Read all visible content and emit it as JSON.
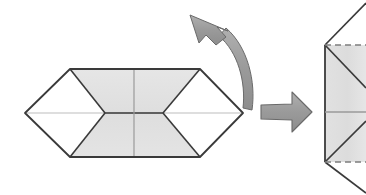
{
  "diagram": {
    "type": "origami-instruction-diagram",
    "canvas": {
      "width": 366,
      "height": 195,
      "background": "#ffffff"
    },
    "palette": {
      "paper_fill_shaded": "#e2e2e2",
      "paper_fill_white": "#ffffff",
      "edge_stroke": "#3a3a3a",
      "soft_crease_stroke": "#b4b4b4",
      "dashed_crease_stroke": "#8c8c8c",
      "arrow_fill": "#9e9e9e",
      "arrow_stroke": "#5a5a5a",
      "background": "#ffffff"
    },
    "panels": [
      {
        "id": "left-figure",
        "name": "flattened-hexagon-model",
        "description": "Wide flattened paper model: shaded central band with white triangular flaps forming diamonds at each end",
        "bounds": {
          "x": 25,
          "y": 69,
          "width": 218,
          "height": 88
        },
        "vertices": {
          "left_tip": [
            25,
            113
          ],
          "top_left": [
            70,
            69
          ],
          "top_right": [
            200,
            69
          ],
          "right_tip": [
            243,
            113
          ],
          "bottom_right": [
            200,
            157
          ],
          "bottom_left": [
            70,
            157
          ],
          "inner_left": [
            105,
            113
          ],
          "inner_right": [
            163,
            113
          ]
        },
        "creases": {
          "vertical_center_x": 134,
          "horizontal_center_y": 113
        }
      },
      {
        "id": "right-figure",
        "name": "rotated-model-partial",
        "description": "Result of the rotation, cropped by the right edge of the image; shaded vertical band with dashed fold lines top and bottom",
        "bounds": {
          "x": 325,
          "y": 0,
          "width": 41,
          "height": 195
        },
        "vertices": {
          "left_edge_x": 325,
          "upper_corner_y": 45,
          "lower_corner_y": 162,
          "horizontal_center_y": 112
        },
        "dashed_lines": [
          {
            "name": "top-dashed-crease",
            "y": 45
          },
          {
            "name": "bottom-dashed-crease",
            "y": 162
          }
        ],
        "cropped": true
      }
    ],
    "arrows": [
      {
        "id": "rotation-arrow",
        "name": "curved-rotation-arrow",
        "direction": "up-left",
        "style": "curved",
        "meaning": "rotate / flip the model"
      },
      {
        "id": "step-arrow",
        "name": "straight-step-arrow",
        "direction": "right",
        "style": "straight-block",
        "meaning": "proceeds to next step"
      }
    ],
    "labels": {
      "step_caption": "",
      "figure_number": ""
    }
  }
}
